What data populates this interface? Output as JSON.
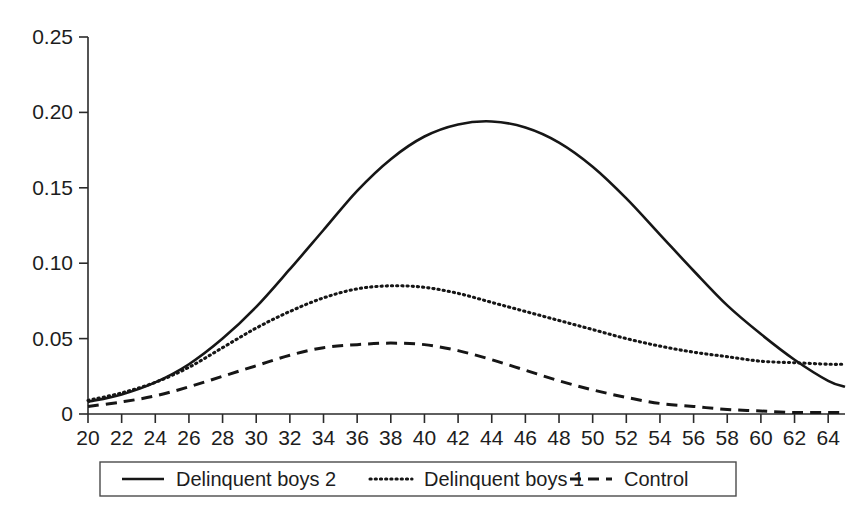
{
  "chart_data": {
    "type": "line",
    "title": "",
    "subtitle": "",
    "xlabel": "",
    "ylabel": "",
    "xlim": [
      20,
      65
    ],
    "ylim": [
      0,
      0.25
    ],
    "grid": false,
    "legend_position": "bottom",
    "y_ticks": [
      0,
      0.05,
      0.1,
      0.15,
      0.2,
      0.25
    ],
    "y_tick_labels": [
      "0",
      "0.05",
      "0.10",
      "0.15",
      "0.20",
      "0.25"
    ],
    "x_ticks": [
      20,
      22,
      24,
      26,
      28,
      30,
      32,
      34,
      36,
      38,
      40,
      42,
      44,
      46,
      48,
      50,
      52,
      54,
      56,
      58,
      60,
      62,
      64
    ],
    "x_tick_labels": [
      "20",
      "22",
      "24",
      "26",
      "28",
      "30",
      "32",
      "34",
      "36",
      "38",
      "40",
      "42",
      "44",
      "46",
      "48",
      "50",
      "52",
      "54",
      "56",
      "58",
      "60",
      "62",
      "64"
    ],
    "x": [
      20,
      22,
      24,
      26,
      28,
      30,
      32,
      34,
      36,
      38,
      40,
      42,
      44,
      46,
      48,
      50,
      52,
      54,
      56,
      58,
      60,
      62,
      64,
      65
    ],
    "series": [
      {
        "name": "Delinquent boys 2",
        "style": "solid",
        "color": "#161616",
        "peak_x": 44,
        "peak_y": 0.194,
        "values": [
          0.008,
          0.013,
          0.021,
          0.033,
          0.05,
          0.071,
          0.096,
          0.122,
          0.148,
          0.169,
          0.184,
          0.192,
          0.194,
          0.19,
          0.18,
          0.164,
          0.143,
          0.119,
          0.095,
          0.072,
          0.053,
          0.036,
          0.022,
          0.018
        ]
      },
      {
        "name": "Delinquent boys 1",
        "style": "dotted",
        "color": "#161616",
        "peak_x": 38,
        "peak_y": 0.085,
        "values": [
          0.009,
          0.014,
          0.021,
          0.031,
          0.044,
          0.057,
          0.068,
          0.077,
          0.083,
          0.085,
          0.084,
          0.08,
          0.074,
          0.068,
          0.062,
          0.056,
          0.05,
          0.045,
          0.041,
          0.038,
          0.035,
          0.034,
          0.033,
          0.033
        ]
      },
      {
        "name": "Control",
        "style": "dashed",
        "color": "#161616",
        "peak_x": 38,
        "peak_y": 0.047,
        "values": [
          0.005,
          0.008,
          0.012,
          0.018,
          0.025,
          0.032,
          0.039,
          0.044,
          0.046,
          0.047,
          0.046,
          0.042,
          0.036,
          0.029,
          0.022,
          0.016,
          0.011,
          0.007,
          0.005,
          0.003,
          0.002,
          0.001,
          0.001,
          0.001
        ]
      }
    ],
    "annotations": [
      "Delinquent boys 2 crosses Delinquent boys 1 near x = 62 at y = 0.034"
    ]
  },
  "legend": {
    "entries": [
      {
        "label": "Delinquent boys 2",
        "style": "solid"
      },
      {
        "label": "Delinquent boys 1",
        "style": "dotted"
      },
      {
        "label": "Control",
        "style": "dashed"
      }
    ]
  }
}
